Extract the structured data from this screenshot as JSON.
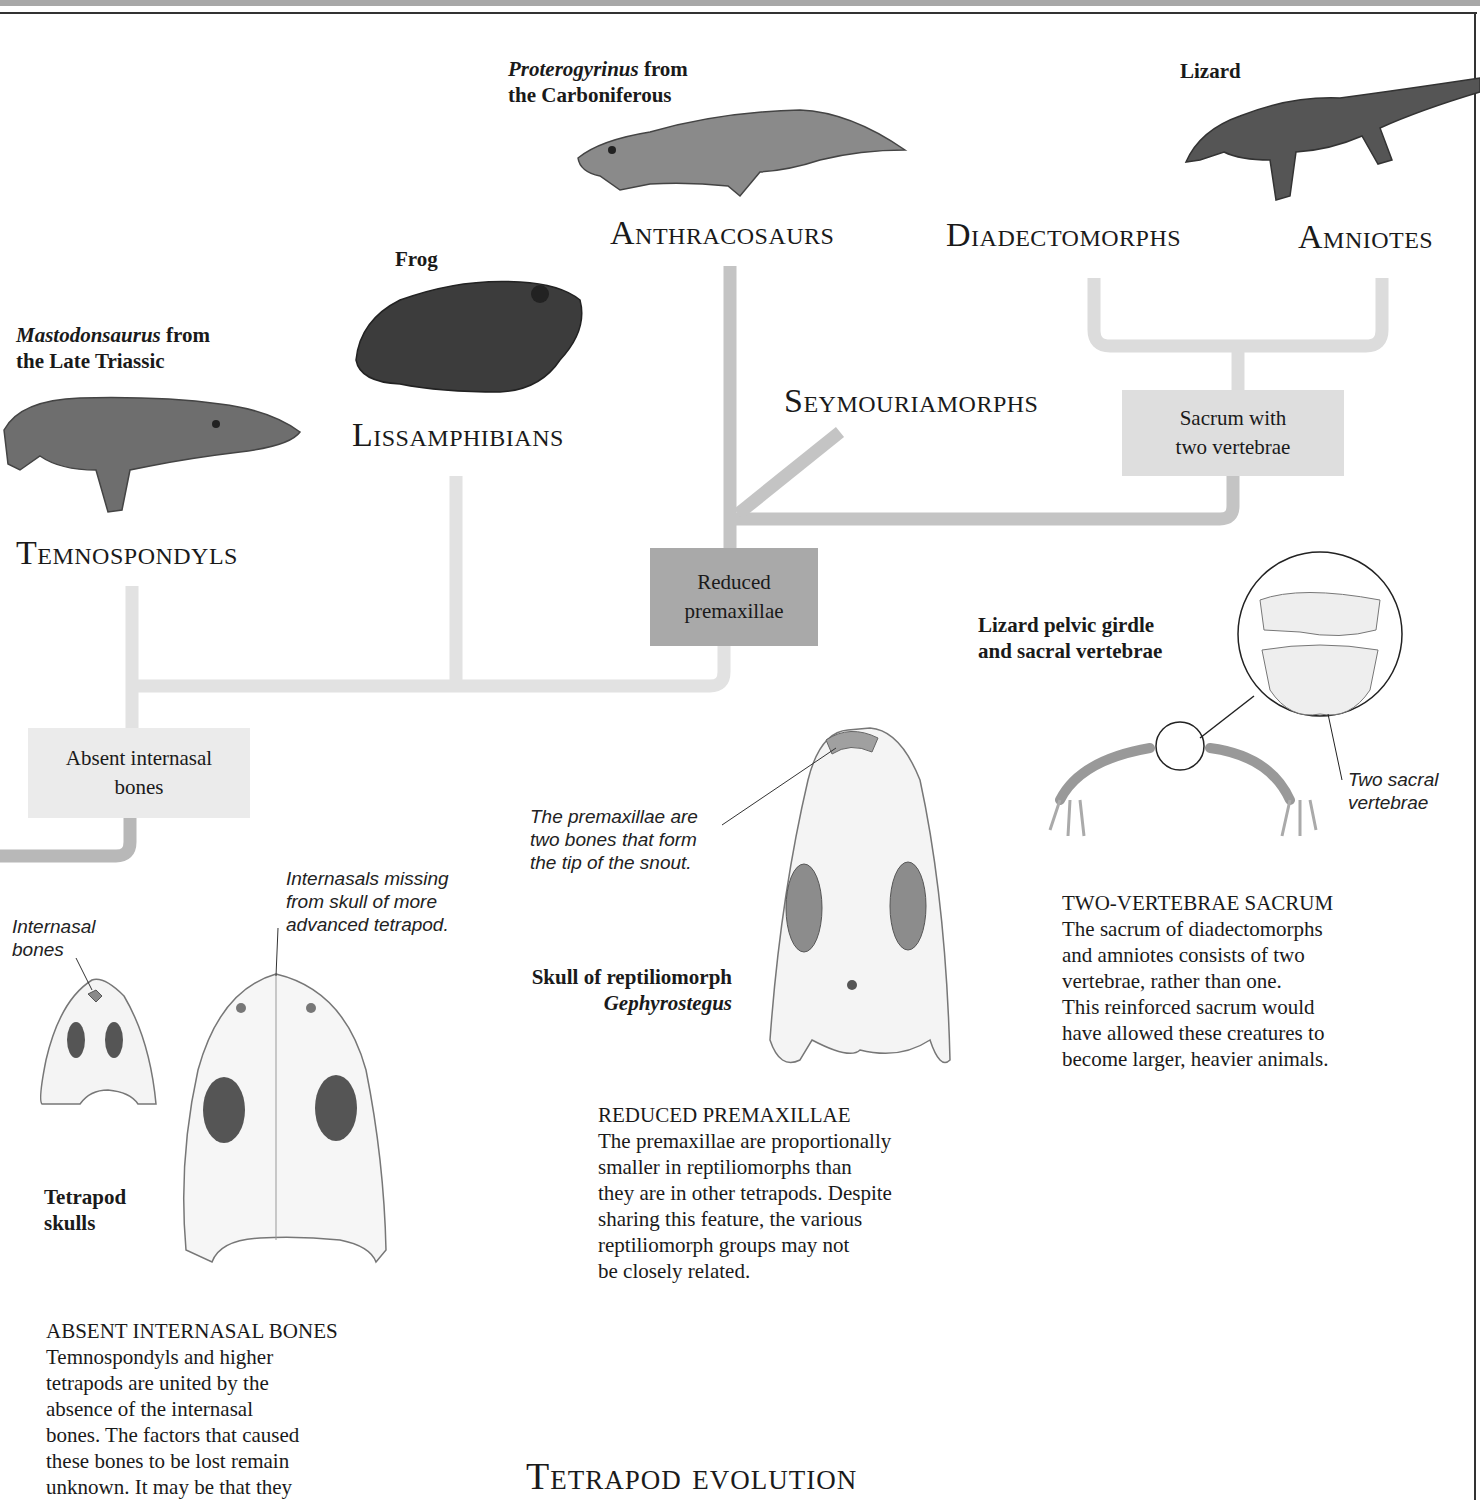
{
  "colors": {
    "branch_light": "#dcdcdc",
    "branch_mid": "#c4c4c4",
    "box_light": "#e6e6e6",
    "box_mid": "#d6d6d6",
    "box_dark": "#a9a9a9",
    "frame": "#333333"
  },
  "specimens": {
    "proterogyrinus": {
      "name": "Proterogyrinus",
      "rest": " from",
      "line2": "the Carboniferous"
    },
    "lizard": {
      "label": "Lizard"
    },
    "frog": {
      "label": "Frog"
    },
    "mastodonsaurus": {
      "name": "Mastodonsaurus",
      "rest": " from",
      "line2": "the Late Triassic"
    }
  },
  "clades": {
    "anthracosaurs": "Anthracosaurs",
    "diadectomorphs": "Diadectomorphs",
    "amniotes": "Amniotes",
    "lissamphibians": "Lissamphibians",
    "seymouriamorphs": "Seymouriamorphs",
    "temnospondyls": "Temnospondyls"
  },
  "characters": {
    "sacrum": {
      "line1": "Sacrum with",
      "line2": "two vertebrae"
    },
    "premaxillae": {
      "line1": "Reduced",
      "line2": "premaxillae"
    },
    "internasal": {
      "line1": "Absent internasal",
      "line2": "bones"
    }
  },
  "figures": {
    "pelvic": {
      "line1": "Lizard pelvic girdle",
      "line2": "and sacral vertebrae",
      "note_line1": "Two sacral",
      "note_line2": "vertebrae"
    },
    "gephyrostegus": {
      "line1": "Skull of reptiliomorph",
      "line2": "Gephyrostegus",
      "note": [
        "The premaxillae are",
        "two bones that form",
        "the tip of the snout."
      ]
    },
    "tetrapod_skulls": {
      "line1": "Tetrapod",
      "line2": "skulls",
      "note_internasal": [
        "Internasal",
        "bones"
      ],
      "note_missing": [
        "Internasals missing",
        "from skull of more",
        "advanced tetrapod."
      ]
    }
  },
  "sections": {
    "sacrum": {
      "heading": "TWO-VERTEBRAE SACRUM",
      "lines": [
        "The sacrum of diadectomorphs",
        "and amniotes consists of two",
        "vertebrae, rather than one.",
        "This reinforced sacrum would",
        "have allowed these creatures to",
        "become larger, heavier animals."
      ]
    },
    "premaxillae": {
      "heading": "REDUCED PREMAXILLAE",
      "lines": [
        "The premaxillae are proportionally",
        "smaller in reptiliomorphs than",
        "they are in other tetrapods. Despite",
        "sharing this feature, the various",
        "reptiliomorph groups may not",
        "be closely related."
      ]
    },
    "internasal": {
      "heading": "ABSENT INTERNASAL BONES",
      "lines": [
        "Temnospondyls and higher",
        "tetrapods are united by the",
        "absence of the internasal",
        "bones. The factors that caused",
        "these bones to be lost remain",
        "unknown. It may be that they"
      ]
    }
  },
  "page_title": "Tetrapod evolution"
}
